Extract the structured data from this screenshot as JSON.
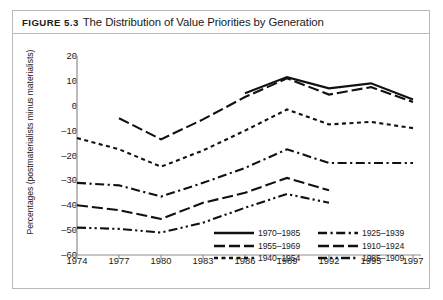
{
  "figure": {
    "label": "Figure 5.3",
    "title": "The Distribution of Value Priorities by Generation"
  },
  "chart_data": {
    "type": "line",
    "title": "The Distribution of Value Priorities by Generation",
    "xlabel": "",
    "ylabel": "Percentages (postmaterialists minus materialists)",
    "x": [
      1974,
      1977,
      1980,
      1983,
      1986,
      1989,
      1992,
      1995,
      1997
    ],
    "xticklabels": [
      "1974",
      "1977",
      "1980",
      "1983",
      "1986",
      "1989",
      "1992",
      "1995",
      "1997"
    ],
    "yticks": [
      20,
      10,
      0,
      -10,
      -20,
      -30,
      -40,
      -50,
      -60
    ],
    "yticklabels": [
      "20",
      "10",
      "0",
      "–10",
      "–20",
      "–30",
      "–40",
      "–50",
      "–60"
    ],
    "ylim": [
      -60,
      20
    ],
    "grid": false,
    "legend_position": "inside-lower-right",
    "series": [
      {
        "name": "1970–1985",
        "dash": "solid",
        "x": [
          1986,
          1989,
          1992,
          1995,
          1997
        ],
        "values": [
          5,
          11.5,
          7,
          9,
          2.5
        ]
      },
      {
        "name": "1955–1969",
        "dash": "long-dash",
        "x": [
          1977,
          1980,
          1983,
          1986,
          1989,
          1992,
          1995,
          1997
        ],
        "values": [
          -5,
          -13.5,
          -5.5,
          3.5,
          11,
          4.5,
          7.5,
          1.5
        ]
      },
      {
        "name": "1940–1954",
        "dash": "short-dash",
        "x": [
          1974,
          1977,
          1980,
          1983,
          1986,
          1989,
          1992,
          1995,
          1997
        ],
        "values": [
          -13,
          -17.5,
          -24.5,
          -18,
          -10,
          -1.5,
          -7.5,
          -6.5,
          -9
        ]
      },
      {
        "name": "1925–1939",
        "dash": "dash-dot",
        "x": [
          1974,
          1977,
          1980,
          1983,
          1986,
          1989,
          1992,
          1995,
          1997
        ],
        "values": [
          -31,
          -32,
          -36.5,
          -31,
          -25,
          -17.5,
          -23,
          -23,
          -23
        ]
      },
      {
        "name": "1910–1924",
        "dash": "long-dash",
        "x": [
          1974,
          1977,
          1980,
          1983,
          1986,
          1989,
          1992
        ],
        "values": [
          -40,
          -42,
          -45.5,
          -39,
          -35,
          -29,
          -34
        ]
      },
      {
        "name": "1985–1909",
        "dash": "dash-dot-dot",
        "x": [
          1974,
          1977,
          1980,
          1983,
          1986,
          1989,
          1992
        ],
        "values": [
          -49,
          -49.5,
          -51,
          -47,
          -41,
          -35.5,
          -39
        ]
      }
    ]
  },
  "legend": {
    "left_column": [
      {
        "label": "1970–1985",
        "dash": "solid"
      },
      {
        "label": "1955–1969",
        "dash": "long-dash"
      },
      {
        "label": "1940–1954",
        "dash": "short-dash"
      }
    ],
    "right_column": [
      {
        "label": "1925–1939",
        "dash": "dash-dot"
      },
      {
        "label": "1910–1924",
        "dash": "long-dash"
      },
      {
        "label": "1985–1909",
        "dash": "dash-dot-dot"
      }
    ]
  },
  "colors": {
    "line": "#111111",
    "axis": "#8d8d8d",
    "frame": "#b9b9b9",
    "background": "#ffffff",
    "text": "#1a1a1a"
  }
}
